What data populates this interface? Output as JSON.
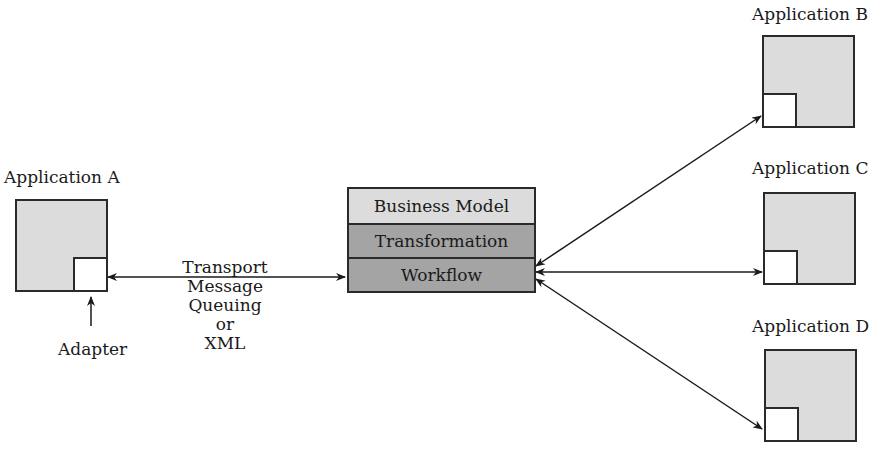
{
  "applications": [
    {
      "id": "A",
      "label": "Application A"
    },
    {
      "id": "B",
      "label": "Application B"
    },
    {
      "id": "C",
      "label": "Application C"
    },
    {
      "id": "D",
      "label": "Application D"
    }
  ],
  "adapter_label": "Adapter",
  "hub": {
    "layers": [
      {
        "label": "Business Model",
        "shade": "light"
      },
      {
        "label": "Transformation",
        "shade": "dark"
      },
      {
        "label": "Workflow",
        "shade": "dark"
      }
    ]
  },
  "transport": {
    "lines": [
      "Transport",
      "Message",
      "Queuing",
      "or",
      "XML"
    ]
  },
  "colors": {
    "app_fill": "#dcdcdc",
    "adapter_fill": "#ffffff",
    "layer_light": "#dcdcdc",
    "layer_dark": "#a4a4a4",
    "stroke": "#2a2a2a"
  }
}
